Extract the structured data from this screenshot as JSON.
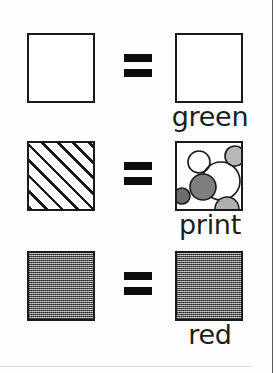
{
  "figure": {
    "type": "pattern-legend",
    "rows": [
      {
        "id": "row-green",
        "left_swatch": {
          "pattern": "plain-white",
          "fill_color": "#ffffff",
          "border_color": "#1a1a1a"
        },
        "operator": "=",
        "right_swatch": {
          "pattern": "plain-white",
          "fill_color": "#ffffff",
          "border_color": "#1a1a1a"
        },
        "label": "green"
      },
      {
        "id": "row-print",
        "left_swatch": {
          "pattern": "diagonal-hatch",
          "fill_color": "#ffffff",
          "line_color": "#1a1a1a"
        },
        "operator": "=",
        "right_swatch": {
          "pattern": "circles-print",
          "fill_color": "#ffffff",
          "border_color": "#1a1a1a"
        },
        "label": "print"
      },
      {
        "id": "row-red",
        "left_swatch": {
          "pattern": "gray-dither-50",
          "fill_color": "#8e8e8e",
          "border_color": "#1a1a1a"
        },
        "operator": "=",
        "right_swatch": {
          "pattern": "gray-dither-50",
          "fill_color": "#8e8e8e",
          "border_color": "#1a1a1a"
        },
        "label": "red"
      }
    ],
    "print_swatch_circles": [
      {
        "cx": 22,
        "cy": 19,
        "r": 11,
        "fill": "none",
        "stroke": "#1a1a1a"
      },
      {
        "cx": 58,
        "cy": 13,
        "r": 10,
        "fill": "#b8b8b8",
        "stroke": "#1a1a1a"
      },
      {
        "cx": 44,
        "cy": 38,
        "r": 19,
        "fill": "none",
        "stroke": "#1a1a1a"
      },
      {
        "cx": 26,
        "cy": 44,
        "r": 13,
        "fill": "#7e7e7e",
        "stroke": "#1a1a1a"
      },
      {
        "cx": 5,
        "cy": 53,
        "r": 8,
        "fill": "#6e6e6e",
        "stroke": "#1a1a1a"
      },
      {
        "cx": 50,
        "cy": 66,
        "r": 12,
        "fill": "#b0b0b0",
        "stroke": "#1a1a1a"
      }
    ],
    "colors": {
      "ink": "#1a1a1a",
      "paper": "#ffffff",
      "mid_gray": "#8e8e8e",
      "light_gray": "#b8b8b8",
      "dark_gray": "#7e7e7e"
    }
  }
}
